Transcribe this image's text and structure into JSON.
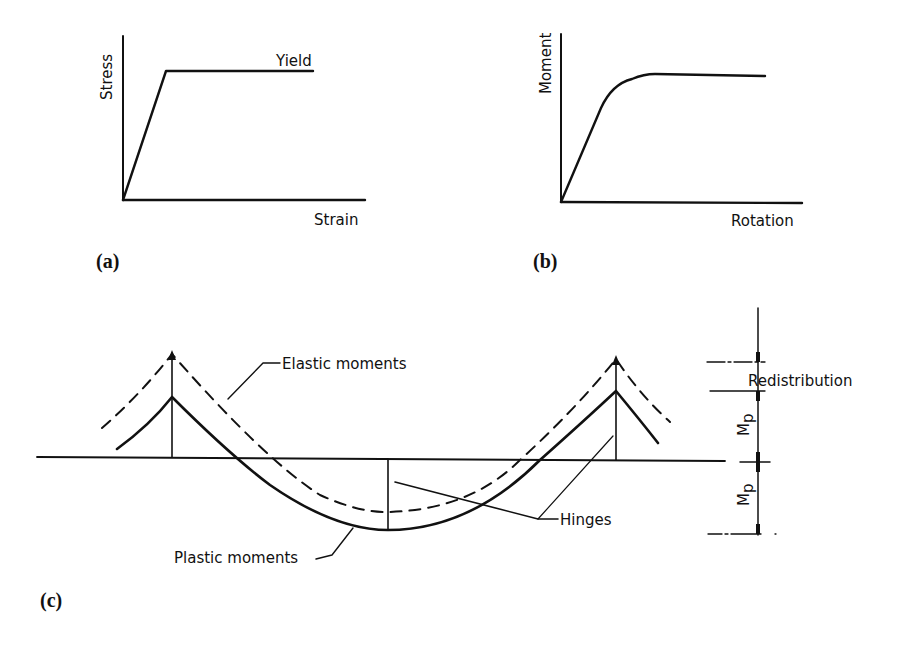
{
  "panel_a": {
    "caption": "(a)",
    "ylabel": "Stress",
    "xlabel": "Strain",
    "annotation": "Yield"
  },
  "panel_b": {
    "caption": "(b)",
    "ylabel": "Moment",
    "xlabel": "Rotation"
  },
  "panel_c": {
    "caption": "(c)",
    "elastic_label": "Elastic moments",
    "plastic_label": "Plastic moments",
    "hinges_label": "Hinges",
    "redistribution_label": "Redistribution",
    "mp_label_top": "M",
    "mp_sub_top": "p",
    "mp_label_bottom": "M",
    "mp_sub_bottom": "p"
  }
}
